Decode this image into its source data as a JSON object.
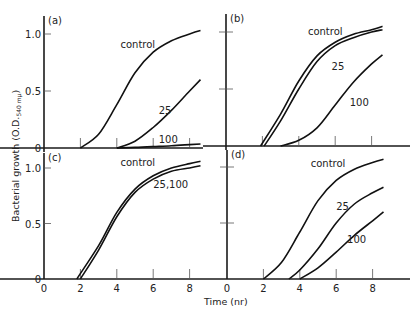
{
  "chart_data": [
    {
      "type": "line",
      "panel": "(a)",
      "x_unit": "hr",
      "xlim": [
        0,
        9
      ],
      "ylim": [
        0,
        1.1
      ],
      "yticks": [
        "0",
        "0.5",
        "1.0"
      ],
      "series": [
        {
          "name": "control",
          "x": [
            0,
            2,
            3,
            4,
            5,
            6,
            7,
            8,
            8.6
          ],
          "y": [
            0,
            0,
            0.12,
            0.38,
            0.66,
            0.84,
            0.94,
            1.0,
            1.03
          ]
        },
        {
          "name": "25",
          "x": [
            0,
            4,
            5,
            6,
            7,
            8,
            8.6
          ],
          "y": [
            0,
            0,
            0.06,
            0.18,
            0.33,
            0.5,
            0.6
          ]
        },
        {
          "name": "100",
          "x": [
            0,
            4,
            5,
            6,
            7,
            8,
            8.6
          ],
          "y": [
            0,
            0,
            0.005,
            0.012,
            0.02,
            0.03,
            0.035
          ]
        }
      ],
      "labels": [
        {
          "text": "control",
          "x": 4.2,
          "y": 0.88
        },
        {
          "text": "25",
          "x": 6.3,
          "y": 0.3
        },
        {
          "text": "100",
          "x": 6.3,
          "y": 0.04
        }
      ]
    },
    {
      "type": "line",
      "panel": "(b)",
      "x_unit": "hr",
      "xlim": [
        0,
        9
      ],
      "ylim": [
        0,
        1.1
      ],
      "yticks": [
        "",
        "",
        ""
      ],
      "series": [
        {
          "name": "control",
          "x": [
            0,
            1.9,
            3,
            4,
            5,
            6,
            7,
            8,
            8.6
          ],
          "y": [
            0,
            0,
            0.28,
            0.57,
            0.79,
            0.91,
            0.98,
            1.02,
            1.05
          ]
        },
        {
          "name": "25",
          "x": [
            0,
            2.1,
            3,
            4,
            5,
            6,
            7,
            8,
            8.6
          ],
          "y": [
            0,
            0,
            0.22,
            0.5,
            0.74,
            0.88,
            0.95,
            1.0,
            1.02
          ]
        },
        {
          "name": "100",
          "x": [
            0,
            3,
            4,
            5,
            6,
            7,
            8,
            8.6
          ],
          "y": [
            0,
            0,
            0.05,
            0.16,
            0.36,
            0.56,
            0.72,
            0.8
          ]
        }
      ],
      "labels": [
        {
          "text": "control",
          "x": 4.5,
          "y": 0.97
        },
        {
          "text": "25",
          "x": 5.8,
          "y": 0.67
        },
        {
          "text": "100",
          "x": 6.8,
          "y": 0.35
        }
      ]
    },
    {
      "type": "line",
      "panel": "(c)",
      "x_unit": "hr",
      "xlim": [
        0,
        9
      ],
      "ylim": [
        0,
        1.1
      ],
      "xticks": [
        "0",
        "2",
        "4",
        "6",
        "8"
      ],
      "yticks": [
        "0",
        "0.5",
        "1.0"
      ],
      "series": [
        {
          "name": "control",
          "x": [
            0,
            1.8,
            3,
            4,
            5,
            6,
            7,
            8,
            8.6
          ],
          "y": [
            0,
            0,
            0.3,
            0.6,
            0.81,
            0.93,
            1.0,
            1.04,
            1.06
          ]
        },
        {
          "name": "25,100",
          "x": [
            0,
            2.0,
            3,
            4,
            5,
            6,
            7,
            8,
            8.6
          ],
          "y": [
            0,
            0,
            0.26,
            0.56,
            0.78,
            0.9,
            0.97,
            1.0,
            1.02
          ]
        }
      ],
      "labels": [
        {
          "text": "control",
          "x": 4.2,
          "y": 1.02
        },
        {
          "text": "25,100",
          "x": 6.0,
          "y": 0.82
        }
      ]
    },
    {
      "type": "line",
      "panel": "(d)",
      "x_unit": "hr",
      "xlim": [
        0,
        9
      ],
      "ylim": [
        0,
        1.1
      ],
      "xticks": [
        "0",
        "2",
        "4",
        "6",
        "8"
      ],
      "yticks": [
        "",
        "",
        ""
      ],
      "series": [
        {
          "name": "control",
          "x": [
            0,
            2.0,
            3,
            4,
            5,
            6,
            7,
            8,
            8.6
          ],
          "y": [
            0,
            0,
            0.15,
            0.42,
            0.7,
            0.88,
            0.98,
            1.04,
            1.07
          ]
        },
        {
          "name": "25",
          "x": [
            0,
            3.4,
            4,
            5,
            6,
            7,
            8,
            8.6
          ],
          "y": [
            0,
            0,
            0.08,
            0.27,
            0.5,
            0.67,
            0.77,
            0.82
          ]
        },
        {
          "name": "100",
          "x": [
            0,
            4.0,
            5,
            6,
            7,
            8,
            8.6
          ],
          "y": [
            0,
            0,
            0.1,
            0.24,
            0.39,
            0.52,
            0.6
          ]
        }
      ],
      "labels": [
        {
          "text": "control",
          "x": 4.6,
          "y": 1.0
        },
        {
          "text": "25",
          "x": 6.0,
          "y": 0.62
        },
        {
          "text": "100",
          "x": 6.6,
          "y": 0.32
        }
      ]
    }
  ],
  "figure": {
    "ylabel": "Bacterial growth (O.D.",
    "ylabel_sub": "540 mμ",
    "ylabel_close": ")",
    "xlabel": "Time (nr)"
  }
}
